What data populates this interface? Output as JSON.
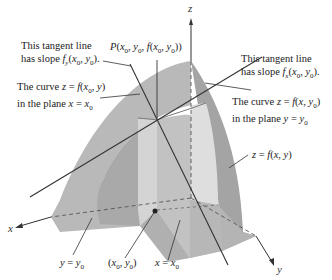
{
  "figure": {
    "axes": {
      "x": "x",
      "y": "y",
      "z": "z"
    },
    "labels": {
      "tangent_y_line1": "This tangent line",
      "tangent_y_line2": "has slope f_y(x0, y0).",
      "curve_x0_line1": "The curve z = f(x0, y)",
      "curve_x0_line2": "in the plane x = x0",
      "point_P": "P(x0, y0, f(x0, y0))",
      "tangent_x_line1": "This tangent line",
      "tangent_x_line2": "has slope f_x(x0, y0).",
      "curve_y0_line1": "The curve z = f(x, y0)",
      "curve_y0_line2": "in the plane y = y0",
      "surface": "z = f(x, y)",
      "plane_y": "y = y0",
      "base_point": "(x0, y0)",
      "plane_x": "x = x0"
    },
    "colors": {
      "surface_outer": "#b4b4b4",
      "surface_dark": "#9e9e9e",
      "surface_light": "#d6d6d6",
      "plane_face": "#c8c8c8",
      "line": "#333333",
      "dashed": "#555555"
    }
  }
}
